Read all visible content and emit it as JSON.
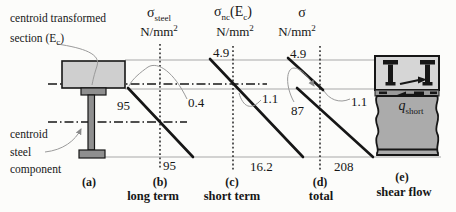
{
  "annotations": {
    "centroid_transformed_line1": "centroid transformed",
    "centroid_transformed_line2_pre": "section (E",
    "centroid_transformed_line2_sub": "c",
    "centroid_transformed_line2_close": ")",
    "centroid_steel_line1": "centroid",
    "centroid_steel_line2": "steel",
    "centroid_steel_line3": "component"
  },
  "section_a": {
    "tag": "(a)"
  },
  "diagrams": {
    "b": {
      "title_sigma": "σ",
      "title_sub": "steel",
      "unit_base": "N/mm",
      "unit_sup": "2",
      "top_value": "95",
      "mid_value": "0.4",
      "bottom_value": "95",
      "tag": "(b)",
      "caption": "long term"
    },
    "c": {
      "title_sigma": "σ",
      "title_sub": "nc",
      "title_paren_open": "(E",
      "title_paren_sub": "c",
      "title_paren_close": ")",
      "unit_base": "N/mm",
      "unit_sup": "2",
      "top_value": "4.9",
      "mid_value": "1.1",
      "bottom_value": "16.2",
      "tag": "(c)",
      "caption": "short term"
    },
    "d": {
      "title_sigma": "σ",
      "unit_base": "N/mm",
      "unit_sup": "2",
      "top_value": "4.9",
      "steel_top_value": "87",
      "slab_bottom_value": "1.1",
      "bottom_value": "208",
      "tag": "(d)",
      "caption": "total"
    },
    "e": {
      "q_label": "q",
      "q_sub": "short",
      "tag": "(e)",
      "caption": "shear flow"
    }
  },
  "colors": {
    "slab_fill": "#cfcfcf",
    "steel_fill": "#8f8f8f",
    "e_slab_fill": "#d6d6d6",
    "interface_fill": "#9a9a9a",
    "block_fill": "#ababab",
    "line_dark": "#161616",
    "line_thin": "#a8a8a8",
    "leader": "#9a9a9a"
  }
}
